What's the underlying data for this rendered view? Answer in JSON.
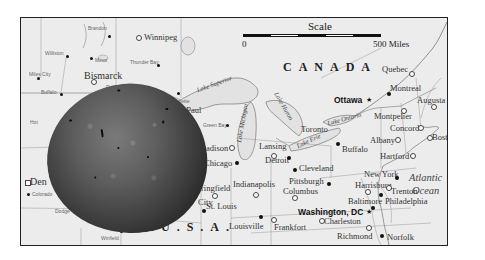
{
  "map": {
    "scale": {
      "title": "Scale",
      "start_label": "0",
      "end_label": "500 Miles"
    },
    "countries": {
      "canada": "CANADA",
      "usa": "U.S.A."
    },
    "water": {
      "ocean_line1": "Atlantic",
      "ocean_line2": "Ocean",
      "lake_superior": "Lake Superior",
      "lake_michigan": "Lake Michigan",
      "lake_huron": "Lake Huron",
      "lake_erie": "Lake Erie",
      "lake_ontario": "Lake Ontario"
    },
    "cities": {
      "brandon": "Brandon",
      "winnipeg": "Winnipeg",
      "williston": "Williston",
      "minot": "Minot",
      "bismarck": "Bismarck",
      "miles_city": "Miles City",
      "buffalo_wy": "Buffalo",
      "hot_springs": "Hot",
      "thunder_bay": "Thunder Bay",
      "duluth": "Duluth",
      "ironwood": "Ironwood",
      "marquette": "Marquette",
      "st_paul": "St. Paul",
      "green_bay": "Green Bay",
      "madison": "adison",
      "chicago": "Chicago",
      "springfield": "ringfield",
      "jefferson_city": "City",
      "st_louis": "St. Louis",
      "indianapolis": "Indianapolis",
      "louisville": "Louisville",
      "frankfort": "Frankfort",
      "lansing": "Lansing",
      "detroit": "Detroit",
      "toronto": "Toronto",
      "ottawa": "Ottawa",
      "quebec": "Quebec",
      "montreal": "Montreal",
      "augusta": "Augusta",
      "montpelier": "Montpelier",
      "concord": "Concord",
      "albany": "Albany",
      "boston": "Boston",
      "buffalo_ny": "Buffalo",
      "hartford": "Hartford",
      "cleveland": "Cleveland",
      "pittsburgh": "Pittsburgh",
      "columbus": "Columbus",
      "harrisburg": "Harrisburg",
      "new_york": "New York",
      "trenton": "Trenton",
      "philadelphia": "Philadelphia",
      "baltimore": "Baltimore",
      "washington": "Washington, DC",
      "charleston": "Charleston",
      "richmond": "Richmond",
      "norfolk": "Norfolk",
      "denver": "Den",
      "colorado_springs": "Colorado",
      "dodge_city": "Dodge",
      "winfield": "Winfield"
    }
  }
}
